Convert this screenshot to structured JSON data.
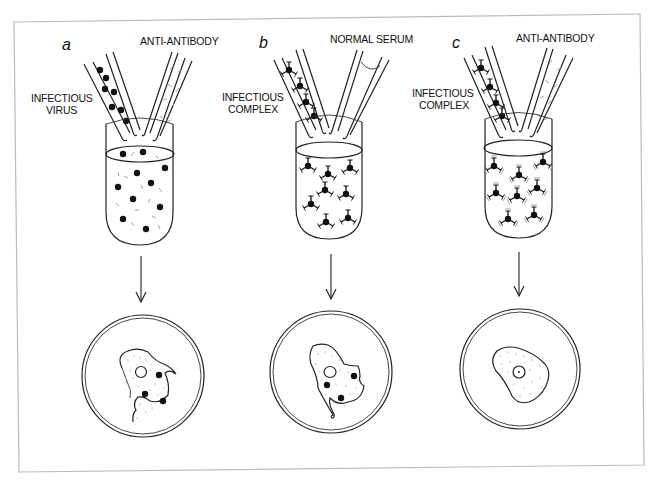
{
  "figure": {
    "frame_color": "#bbbbbb",
    "ink_color": "#222222",
    "panels": [
      {
        "id": "a",
        "letter": "a",
        "left_pipette_label_line1": "INFECTIOUS",
        "left_pipette_label_line2": "VIRUS",
        "right_pipette_label": "ANTI-ANTIBODY",
        "tube_contents": "free virus particles with antibody fragments",
        "result": "infected cell with virus particles"
      },
      {
        "id": "b",
        "letter": "b",
        "left_pipette_label_line1": "INFECTIOUS",
        "left_pipette_label_line2": "COMPLEX",
        "right_pipette_label": "NORMAL SERUM",
        "tube_contents": "virus-antibody complexes",
        "result": "infected cell with virus particles"
      },
      {
        "id": "c",
        "letter": "c",
        "left_pipette_label_line1": "INFECTIOUS",
        "left_pipette_label_line2": "COMPLEX",
        "right_pipette_label": "ANTI-ANTIBODY",
        "tube_contents": "complexes bound by anti-antibody",
        "result": "uninfected cell"
      }
    ]
  }
}
